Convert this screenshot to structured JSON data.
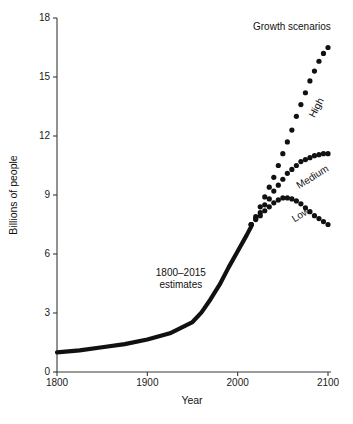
{
  "chart_data": {
    "type": "line",
    "title": "",
    "xlabel": "Year",
    "ylabel": "Billions of people",
    "xlim": [
      1800,
      2100
    ],
    "ylim": [
      0,
      18
    ],
    "xticks": [
      1800,
      1900,
      2000,
      2100
    ],
    "yticks": [
      0,
      3,
      6,
      9,
      12,
      15,
      18
    ],
    "grid": false,
    "legend": "none",
    "annotations": [
      {
        "name": "estimates-label",
        "text_line1": "1800–2015",
        "text_line2": "estimates",
        "x": 1937,
        "y": 4.9
      },
      {
        "name": "growth-scenarios-label",
        "text": "Growth scenarios",
        "x": 2060,
        "y": 17.4
      },
      {
        "name": "high-label",
        "text": "High",
        "x": 2085,
        "y": 12.9,
        "rotation": -62
      },
      {
        "name": "medium-label",
        "text": "Medium",
        "x": 2068,
        "y": 9.3,
        "rotation": -32
      },
      {
        "name": "low-label",
        "text": "Low",
        "x": 2063,
        "y": 7.6,
        "rotation": -32
      }
    ],
    "series": [
      {
        "name": "1800–2015 estimates",
        "style": "solid-line",
        "x": [
          1800,
          1825,
          1850,
          1875,
          1900,
          1925,
          1950,
          1960,
          1970,
          1980,
          1990,
          2000,
          2010,
          2015
        ],
        "values": [
          1.0,
          1.1,
          1.26,
          1.42,
          1.65,
          1.97,
          2.54,
          3.03,
          3.7,
          4.44,
          5.32,
          6.14,
          6.96,
          7.4
        ]
      },
      {
        "name": "High",
        "style": "dotted",
        "x": [
          2015,
          2020,
          2025,
          2030,
          2035,
          2040,
          2045,
          2050,
          2055,
          2060,
          2065,
          2070,
          2075,
          2080,
          2085,
          2090,
          2095,
          2100
        ],
        "values": [
          7.5,
          7.9,
          8.4,
          8.9,
          9.4,
          9.9,
          10.5,
          11.1,
          11.7,
          12.3,
          13.0,
          13.6,
          14.2,
          14.8,
          15.3,
          15.8,
          16.2,
          16.5
        ]
      },
      {
        "name": "Medium",
        "style": "dotted",
        "x": [
          2015,
          2020,
          2025,
          2030,
          2035,
          2040,
          2045,
          2050,
          2055,
          2060,
          2065,
          2070,
          2075,
          2080,
          2085,
          2090,
          2095,
          2100
        ],
        "values": [
          7.5,
          7.8,
          8.1,
          8.5,
          8.8,
          9.2,
          9.5,
          9.8,
          10.1,
          10.3,
          10.5,
          10.7,
          10.8,
          10.9,
          11.0,
          11.05,
          11.1,
          11.1
        ]
      },
      {
        "name": "Low",
        "style": "dotted",
        "x": [
          2015,
          2020,
          2025,
          2030,
          2035,
          2040,
          2045,
          2050,
          2055,
          2060,
          2065,
          2070,
          2075,
          2080,
          2085,
          2090,
          2095,
          2100
        ],
        "values": [
          7.5,
          7.75,
          7.95,
          8.2,
          8.4,
          8.6,
          8.75,
          8.85,
          8.85,
          8.8,
          8.7,
          8.55,
          8.35,
          8.15,
          7.95,
          7.8,
          7.65,
          7.5
        ]
      }
    ]
  },
  "colors": {
    "ink": "#111111",
    "axis": "#3a3a3a",
    "background": "#ffffff"
  }
}
